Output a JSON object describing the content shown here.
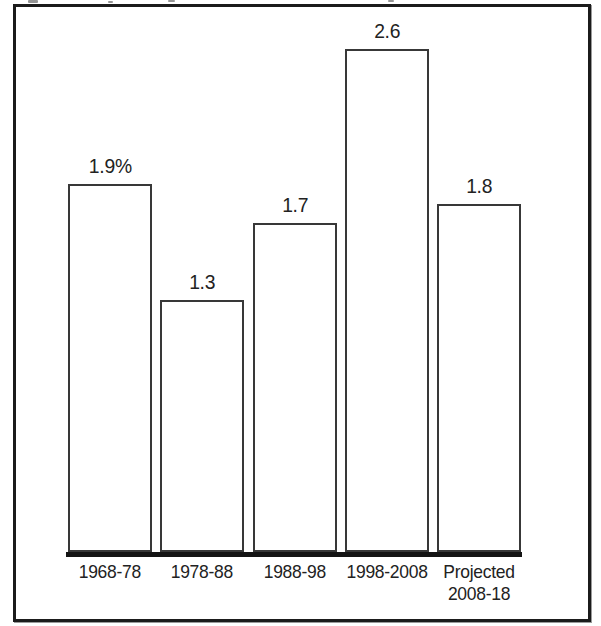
{
  "chart_data": {
    "type": "bar",
    "title": "",
    "xlabel": "",
    "ylabel": "",
    "categories": [
      "1968-78",
      "1978-88",
      "1988-98",
      "1998-2008",
      "Projected 2008-18"
    ],
    "values": [
      1.9,
      1.3,
      1.7,
      2.6,
      1.8
    ],
    "value_labels": [
      "1.9%",
      "1.3",
      "1.7",
      "2.6",
      "1.8"
    ],
    "ylim": [
      0,
      2.85
    ],
    "grid": false,
    "legend": false,
    "bar_fill": "#ffffff",
    "bar_outline": "#383838",
    "baseline_color": "#141414",
    "frame_color": "#1b1b1b",
    "text_color": "#222222",
    "background": "#ffffff"
  }
}
